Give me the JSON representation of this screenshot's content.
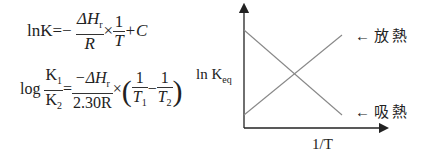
{
  "equations": {
    "eq1": {
      "lhs": "lnK",
      "eq": "=−",
      "num": "ΔH",
      "num_sub": "r",
      "den": "R",
      "times": "×",
      "num2": "1",
      "den2": "T",
      "tail": "+C"
    },
    "eq2": {
      "log": "log",
      "k_num": "K",
      "k_num_sub": "1",
      "k_den": "K",
      "k_den_sub": "2",
      "eq": "=",
      "num": "−ΔH",
      "num_sub": "r",
      "den": "2.30R",
      "times": "×",
      "f1_num": "1",
      "f1_den": "T",
      "f1_sub": "1",
      "minus": "−",
      "f2_num": "1",
      "f2_den": "T",
      "f2_sub": "2"
    }
  },
  "graph": {
    "y_label": "ln K",
    "y_label_sub": "eq",
    "x_label": "1/T",
    "line_labels": [
      {
        "arrow": "←",
        "text": "放熱"
      },
      {
        "arrow": "←",
        "text": "吸熱"
      }
    ],
    "line_color": "#888888",
    "axis_color": "#222222"
  }
}
